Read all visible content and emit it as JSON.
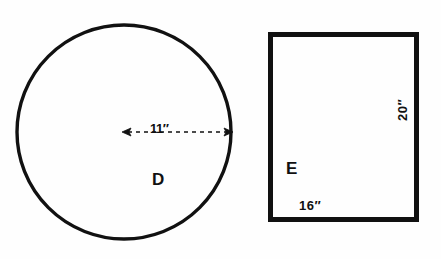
{
  "figure": {
    "background_color": "#fefefe",
    "stroke_color": "#111111",
    "shapes": [
      {
        "id": "D",
        "name": "circle",
        "label": "D",
        "center": {
          "x": 124,
          "y": 132
        },
        "radius_px": 109,
        "stroke_width": 3,
        "fill": "none",
        "dimension": {
          "kind": "radius",
          "label": "11″",
          "value": 11,
          "unit": "inches",
          "line_style": "dashed",
          "arrow_start": {
            "x": 124,
            "y": 132
          },
          "arrow_end": {
            "x": 232,
            "y": 132
          },
          "arrowheads": "both"
        }
      },
      {
        "id": "E",
        "name": "rectangle",
        "label": "E",
        "x": 268,
        "y": 32,
        "width": 151,
        "height": 190,
        "stroke_width": 5,
        "fill": "none",
        "dimensions": [
          {
            "kind": "width",
            "label": "16″",
            "value": 16,
            "unit": "inches",
            "position": "bottom-inside",
            "rotation": 0
          },
          {
            "kind": "height",
            "label": "20″",
            "value": 20,
            "unit": "inches",
            "position": "right-inside",
            "rotation": -90
          }
        ]
      }
    ]
  }
}
